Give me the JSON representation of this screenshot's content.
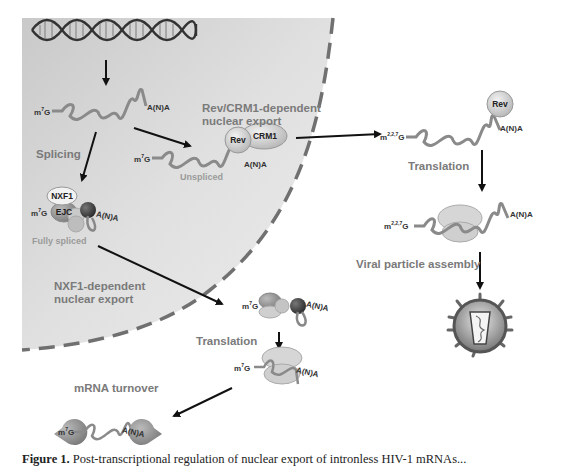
{
  "figure": {
    "compartments": {
      "nucleus_fill": "#d9d9d9",
      "cytoplasm_fill": "#ffffff",
      "membrane_style": "dashed",
      "membrane_color": "#6e6e6e"
    },
    "labels": {
      "splicing": "Splicing",
      "rev_export_1": "Rev/CRM1-dependent",
      "rev_export_2": "nuclear export",
      "nxf1_export_1": "NXF1-dependent",
      "nxf1_export_2": "nuclear export",
      "translation_left": "Translation",
      "translation_right": "Translation",
      "viral_assembly": "Viral particle assembly",
      "mrna_turnover": "mRNA turnover",
      "unspliced": "Unspliced",
      "fully_spliced": "Fully spliced"
    },
    "proteins": {
      "rev": "Rev",
      "crm1": "CRM1",
      "nxf1": "NXF1",
      "ejc": "EJC",
      "rev_cyto": "Rev"
    },
    "caps": {
      "m7g": "m",
      "m7g_sup": "7",
      "m7g_g": "G",
      "tmg_sup": "2,2,7",
      "polyA": "A(N)A"
    },
    "caption": {
      "label": "Figure 1.",
      "text": "Post-transcriptional regulation of nuclear export of intronless HIV-1 mRNAs..."
    }
  }
}
